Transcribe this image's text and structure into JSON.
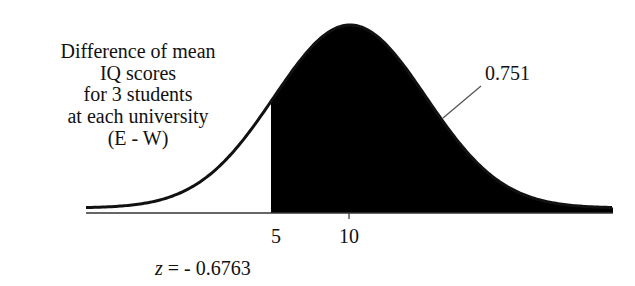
{
  "description": {
    "lines": [
      "Difference of mean",
      "IQ scores",
      "for 3 students",
      "at each university",
      "(E - W)"
    ]
  },
  "annotations": {
    "shaded_area_label": "0.751",
    "z_variable": "z",
    "z_equals": " = - 0.6763"
  },
  "axis": {
    "ticks": [
      {
        "label": "5"
      },
      {
        "label": "10"
      }
    ]
  },
  "colors": {
    "fill": "#000000",
    "curve": "#111111",
    "axis": "#333333",
    "background": "#ffffff"
  },
  "chart_data": {
    "type": "area",
    "title": "",
    "description_text": "Difference of mean IQ scores for 3 students at each university (E - W)",
    "xlabel": "",
    "ylabel": "",
    "distribution": "normal",
    "mean": 10,
    "cutoff": 5,
    "z_score": -0.6763,
    "shaded_region": "x > 5 (right of cutoff)",
    "shaded_area": 0.751,
    "x_ticks": [
      5,
      10
    ],
    "annotations": [
      "0.751",
      "z = - 0.6763"
    ],
    "grid": false,
    "legend": null
  }
}
